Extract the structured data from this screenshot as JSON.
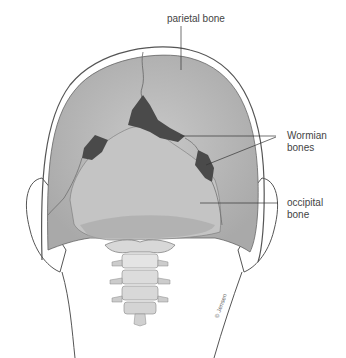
{
  "figure": {
    "labels": {
      "parietal": "parietal bone",
      "wormian_line1": "Wormian",
      "wormian_line2": "bones",
      "occipital_line1": "occipital",
      "occipital_line2": "bone"
    },
    "signature": "© Jensen",
    "colors": {
      "bone": "#b9b9b9",
      "bone_light": "#c9c9c9",
      "wormian": "#4a4a4a",
      "outline": "#555555",
      "leader": "#333333"
    }
  }
}
